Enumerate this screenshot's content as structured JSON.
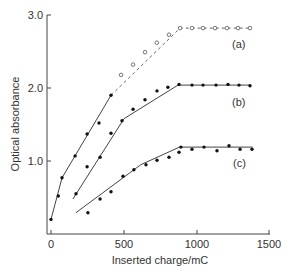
{
  "chart_data": {
    "type": "line",
    "title": "",
    "xlabel": "Inserted charge/mC",
    "ylabel": "Optical absorbance",
    "xlim": [
      0,
      1500
    ],
    "ylim": [
      0.0,
      3.0
    ],
    "x_ticks": [
      0,
      500,
      1000,
      1500
    ],
    "x_tick_labels": [
      "0",
      "500",
      "1000",
      "1500"
    ],
    "y_ticks": [
      1.0,
      2.0,
      3.0
    ],
    "y_tick_labels": [
      "1.0",
      "2.0",
      "3.0"
    ],
    "grid": false,
    "legend": "inline labels at right end of each curve",
    "series": [
      {
        "name": "(a)",
        "marker": "filled circle then open circle",
        "points_filled": [
          [
            0,
            0.2
          ],
          [
            50,
            0.52
          ],
          [
            75,
            0.77
          ],
          [
            165,
            1.07
          ],
          [
            247,
            1.37
          ],
          [
            329,
            1.52
          ],
          [
            411,
            1.9
          ]
        ],
        "points_open": [
          [
            480,
            2.18
          ],
          [
            562,
            2.32
          ],
          [
            644,
            2.49
          ],
          [
            725,
            2.62
          ],
          [
            808,
            2.73
          ],
          [
            884,
            2.82
          ],
          [
            966,
            2.82
          ],
          [
            1041,
            2.82
          ],
          [
            1123,
            2.82
          ],
          [
            1205,
            2.82
          ],
          [
            1281,
            2.82
          ],
          [
            1363,
            2.82
          ]
        ],
        "fit_solid": [
          [
            0,
            0.2
          ],
          [
            75,
            0.77
          ],
          [
            411,
            1.9
          ]
        ],
        "fit_dashed": [
          [
            411,
            1.9
          ],
          [
            884,
            2.82
          ],
          [
            1363,
            2.82
          ]
        ]
      },
      {
        "name": "(b)",
        "marker": "filled circle",
        "points": [
          [
            171,
            0.55
          ],
          [
            247,
            0.92
          ],
          [
            336,
            1.05
          ],
          [
            411,
            1.38
          ],
          [
            486,
            1.55
          ],
          [
            562,
            1.71
          ],
          [
            644,
            1.84
          ],
          [
            726,
            1.96
          ],
          [
            801,
            2.01
          ],
          [
            877,
            2.05
          ],
          [
            966,
            2.04
          ],
          [
            1041,
            2.04
          ],
          [
            1130,
            2.04
          ],
          [
            1212,
            2.05
          ],
          [
            1288,
            2.04
          ],
          [
            1363,
            2.03
          ]
        ],
        "fit": [
          [
            150,
            0.48
          ],
          [
            500,
            1.58
          ],
          [
            870,
            2.04
          ],
          [
            1370,
            2.04
          ]
        ]
      },
      {
        "name": "(c)",
        "marker": "filled circle",
        "points": [
          [
            253,
            0.29
          ],
          [
            336,
            0.48
          ],
          [
            411,
            0.58
          ],
          [
            493,
            0.79
          ],
          [
            568,
            0.88
          ],
          [
            651,
            0.95
          ],
          [
            726,
            1.01
          ],
          [
            808,
            1.05
          ],
          [
            877,
            1.12
          ],
          [
            890,
            1.19
          ],
          [
            966,
            1.16
          ],
          [
            1048,
            1.19
          ],
          [
            1137,
            1.14
          ],
          [
            1219,
            1.21
          ],
          [
            1295,
            1.16
          ],
          [
            1377,
            1.16
          ]
        ],
        "fit": [
          [
            170,
            0.29
          ],
          [
            615,
            0.95
          ],
          [
            880,
            1.19
          ],
          [
            1380,
            1.19
          ]
        ]
      }
    ]
  },
  "axes": {
    "xlabel": "Inserted charge/mC",
    "ylabel": "Optical absorbance",
    "x_ticks": [
      "0",
      "500",
      "1000",
      "1500"
    ],
    "y_ticks": [
      "1.0",
      "2.0",
      "3.0"
    ]
  },
  "labels": {
    "a": "(a)",
    "b": "(b)",
    "c": "(c)"
  }
}
